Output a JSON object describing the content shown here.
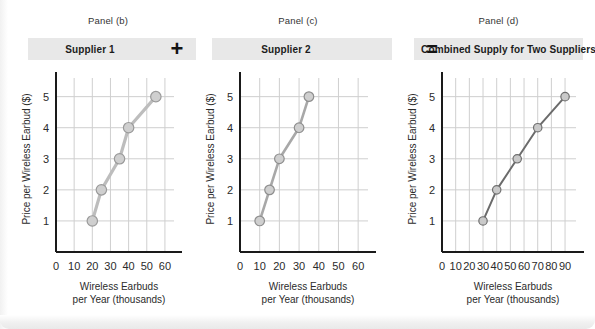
{
  "figure": {
    "background_color": "#ffffff",
    "header_bar_color": "#e8e8e8",
    "grid_color": "#cfcfcf",
    "axis_color": "#1a1a1a"
  },
  "operators": {
    "plus": "+",
    "equals": "="
  },
  "panels": [
    {
      "tag": "Panel (b)",
      "title": "Supplier 1",
      "xlabel_line1": "Wireless Earbuds",
      "xlabel_line2": "per Year (thousands)",
      "ylabel": "Price per Wireless Earbud ($)",
      "origin_label": "0",
      "xticks": [
        10,
        20,
        30,
        40,
        50,
        60
      ],
      "yticks": [
        1,
        2,
        3,
        4,
        5
      ],
      "xlim": [
        0,
        65
      ],
      "ylim": [
        0,
        5.6
      ],
      "line_color": "#bdbdbd",
      "line_width": 3.2,
      "marker_fill": "#cfcfcf",
      "marker_stroke": "#9a9a9a",
      "marker_radius": 5.2
    },
    {
      "tag": "Panel (c)",
      "title": "Supplier 2",
      "xlabel_line1": "Wireless Earbuds",
      "xlabel_line2": "per Year (thousands)",
      "ylabel": "Price per Wireless Earbud ($)",
      "origin_label": "0",
      "xticks": [
        10,
        20,
        30,
        40,
        50,
        60
      ],
      "yticks": [
        1,
        2,
        3,
        4,
        5
      ],
      "xlim": [
        0,
        65
      ],
      "ylim": [
        0,
        5.6
      ],
      "line_color": "#a8a8a8",
      "line_width": 2.6,
      "marker_fill": "#cfcfcf",
      "marker_stroke": "#8e8e8e",
      "marker_radius": 4.8
    },
    {
      "tag": "Panel (d)",
      "title": "Combined Supply for Two Suppliers",
      "xlabel_line1": "Wireless Earbuds",
      "xlabel_line2": "per Year (thousands)",
      "ylabel": "Price per Wireless Earbud ($)",
      "origin_label": "0",
      "xticks": [
        10,
        20,
        30,
        40,
        50,
        60,
        70,
        80,
        90
      ],
      "yticks": [
        1,
        2,
        3,
        4,
        5
      ],
      "xlim": [
        0,
        98
      ],
      "ylim": [
        0,
        5.6
      ],
      "line_color": "#6b6b6b",
      "line_width": 2.0,
      "marker_fill": "#c9c9c9",
      "marker_stroke": "#6f6f6f",
      "marker_radius": 4.2
    }
  ],
  "chart_data": [
    {
      "type": "line",
      "title": "Supplier 1",
      "subtitle": "Panel (b)",
      "xlabel": "Wireless Earbuds per Year (thousands)",
      "ylabel": "Price per Wireless Earbud ($)",
      "x": [
        20,
        25,
        35,
        40,
        55
      ],
      "y": [
        1,
        2,
        3,
        4,
        5
      ],
      "xticks": [
        0,
        10,
        20,
        30,
        40,
        50,
        60
      ],
      "yticks": [
        1,
        2,
        3,
        4,
        5
      ],
      "xlim": [
        0,
        65
      ],
      "ylim": [
        0,
        5.6
      ],
      "grid": true,
      "legend": "none",
      "series": [
        {
          "name": "Supplier 1 supply curve",
          "x": [
            20,
            25,
            35,
            40,
            55
          ],
          "y": [
            1,
            2,
            3,
            4,
            5
          ]
        }
      ]
    },
    {
      "type": "line",
      "title": "Supplier 2",
      "subtitle": "Panel (c)",
      "xlabel": "Wireless Earbuds per Year (thousands)",
      "ylabel": "Price per Wireless Earbud ($)",
      "x": [
        10,
        15,
        20,
        30,
        35
      ],
      "y": [
        1,
        2,
        3,
        4,
        5
      ],
      "xticks": [
        0,
        10,
        20,
        30,
        40,
        50,
        60
      ],
      "yticks": [
        1,
        2,
        3,
        4,
        5
      ],
      "xlim": [
        0,
        65
      ],
      "ylim": [
        0,
        5.6
      ],
      "grid": true,
      "legend": "none",
      "series": [
        {
          "name": "Supplier 2 supply curve",
          "x": [
            10,
            15,
            20,
            30,
            35
          ],
          "y": [
            1,
            2,
            3,
            4,
            5
          ]
        }
      ]
    },
    {
      "type": "line",
      "title": "Combined Supply for Two Suppliers",
      "subtitle": "Panel (d)",
      "xlabel": "Wireless Earbuds per Year (thousands)",
      "ylabel": "Price per Wireless Earbud ($)",
      "x": [
        30,
        40,
        55,
        70,
        90
      ],
      "y": [
        1,
        2,
        3,
        4,
        5
      ],
      "xticks": [
        0,
        10,
        20,
        30,
        40,
        50,
        60,
        70,
        80,
        90
      ],
      "yticks": [
        1,
        2,
        3,
        4,
        5
      ],
      "xlim": [
        0,
        98
      ],
      "ylim": [
        0,
        5.6
      ],
      "grid": true,
      "legend": "none",
      "series": [
        {
          "name": "Combined supply curve (horizontal sum)",
          "x": [
            30,
            40,
            55,
            70,
            90
          ],
          "y": [
            1,
            2,
            3,
            4,
            5
          ]
        }
      ]
    }
  ]
}
